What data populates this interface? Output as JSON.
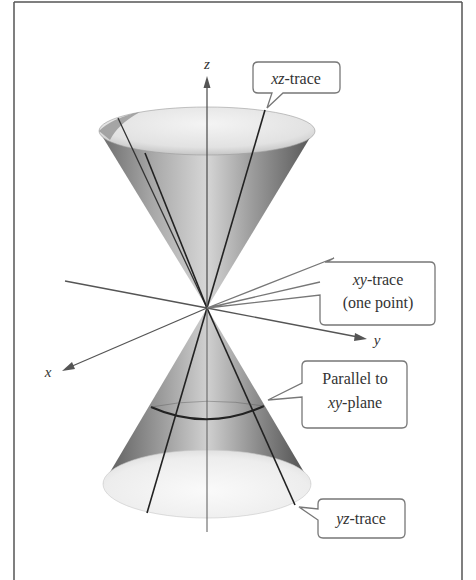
{
  "figure": {
    "axes": {
      "x_label": "x",
      "y_label": "y",
      "z_label": "z"
    },
    "callouts": [
      {
        "id": "xz-trace",
        "lines": [
          {
            "italic": "xz",
            "rest": "-trace"
          }
        ]
      },
      {
        "id": "xy-trace",
        "lines": [
          {
            "italic": "xy",
            "rest": "-trace"
          },
          {
            "italic": "",
            "rest": "(one point)"
          }
        ]
      },
      {
        "id": "parallel",
        "lines": [
          {
            "italic": "",
            "rest": "Parallel to"
          },
          {
            "italic": "xy",
            "rest": "-plane"
          }
        ]
      },
      {
        "id": "yz-trace",
        "lines": [
          {
            "italic": "yz",
            "rest": "-trace"
          }
        ]
      }
    ],
    "colors": {
      "frame": "#555555",
      "axis": "#555555",
      "trace_line": "#222222",
      "callout_border": "#777777",
      "text": "#333333"
    }
  }
}
